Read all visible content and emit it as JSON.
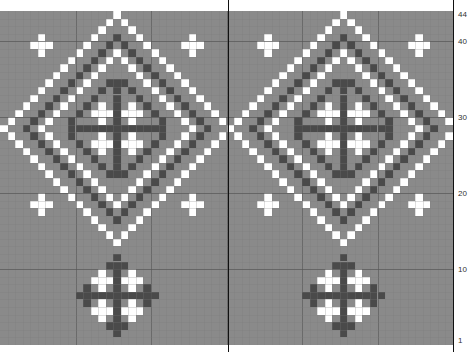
{
  "chart_title": "",
  "grid": {
    "columns": 60,
    "rows": 44,
    "repeat_width": 30
  },
  "colors": {
    "background": "#8a8a8a",
    "white_stitch": "#ffffff",
    "dark_stitch": "#4a4a4a",
    "grid_line": "#7a7a7a",
    "major_line": "#555555"
  },
  "row_labels": [
    {
      "row": 44,
      "text": "44"
    },
    {
      "row": 40,
      "text": "40"
    },
    {
      "row": 30,
      "text": "30"
    },
    {
      "row": 20,
      "text": "20"
    },
    {
      "row": 10,
      "text": "10"
    },
    {
      "row": 1,
      "text": "1"
    }
  ],
  "motifs": {
    "large_diamond": {
      "center_col": 15,
      "center_row": 29,
      "white_radii": [
        15,
        10
      ],
      "dark_radii": [
        12
      ]
    },
    "small_medallion": {
      "center_col": 15,
      "center_row": 7,
      "radius": 5
    },
    "small_crosses": [
      {
        "col": 5,
        "row": 40
      },
      {
        "col": 25,
        "row": 40
      },
      {
        "col": 5,
        "row": 19
      },
      {
        "col": 25,
        "row": 19
      }
    ]
  }
}
